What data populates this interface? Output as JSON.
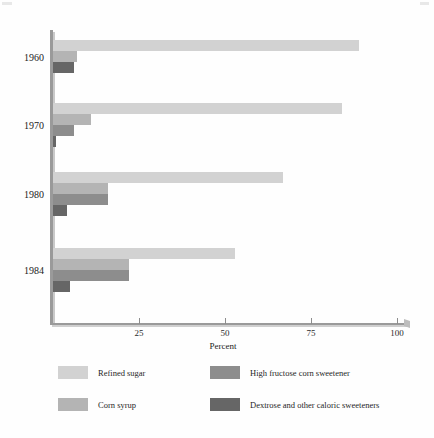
{
  "chart_data": {
    "type": "bar",
    "orientation": "horizontal",
    "title": "",
    "xlabel": "Percent",
    "ylabel": "",
    "xlim": [
      0,
      100
    ],
    "xticks": [
      0,
      25,
      50,
      75,
      100
    ],
    "xtick_labels": [
      "",
      "25",
      "50",
      "75",
      "100"
    ],
    "categories": [
      "1960",
      "1970",
      "1980",
      "1984"
    ],
    "grid": false,
    "legend_position": "bottom",
    "series": [
      {
        "name": "Refined sugar",
        "color": "#d2d2d2",
        "values": [
          89,
          84,
          67,
          53
        ]
      },
      {
        "name": "Corn syrup",
        "color": "#b4b4b4",
        "values": [
          7,
          11,
          16,
          22
        ]
      },
      {
        "name": "High fructose corn sweetener",
        "color": "#8d8d8d",
        "values": [
          0,
          6,
          16,
          22
        ]
      },
      {
        "name": "Dextrose and other caloric sweeteners",
        "color": "#666666",
        "values": [
          6,
          1,
          4,
          5
        ]
      }
    ]
  },
  "axis": {
    "x_title": "Percent",
    "tick_labels": [
      "25",
      "50",
      "75",
      "100"
    ],
    "year_labels": [
      "1960",
      "1970",
      "1980",
      "1984"
    ]
  },
  "legend": {
    "items": [
      {
        "label": "Refined sugar",
        "color": "#d2d2d2"
      },
      {
        "label": "Corn syrup",
        "color": "#b4b4b4"
      },
      {
        "label": "High fructose corn sweetener",
        "color": "#8d8d8d"
      },
      {
        "label": "Dextrose and other caloric sweeteners",
        "color": "#666666"
      }
    ]
  },
  "colors": {
    "refined_sugar": "#d2d2d2",
    "corn_syrup": "#b4b4b4",
    "hfcs": "#8d8d8d",
    "dextrose": "#666666",
    "axis": "#9a9a9a",
    "background": "#fefefe"
  }
}
